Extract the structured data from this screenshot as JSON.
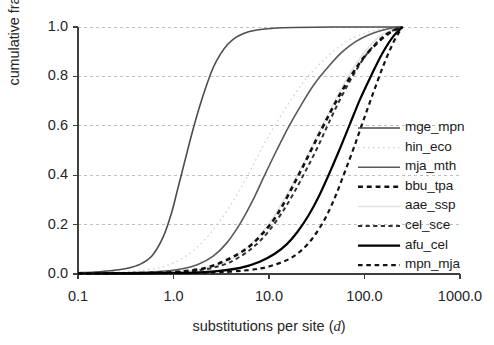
{
  "chart_data": {
    "type": "line",
    "title": "",
    "xlabel": "substitutions per site (d)",
    "xlabel_plain": "substitutions per site",
    "xlabel_italic_symbol": "d",
    "ylabel": "cumulative fraction",
    "xscale": "log",
    "yscale": "linear",
    "xlim": [
      0.1,
      1000.0
    ],
    "ylim": [
      0.0,
      1.0
    ],
    "xticks": [
      "0.1",
      "1.0",
      "10.0",
      "100.0",
      "1000.0"
    ],
    "xtick_values": [
      0.1,
      1.0,
      10.0,
      100.0,
      1000.0
    ],
    "yticks": [
      "0.0",
      "0.2",
      "0.4",
      "0.6",
      "0.8",
      "1.0"
    ],
    "ytick_values": [
      0.0,
      0.2,
      0.4,
      0.6,
      0.8,
      1.0
    ],
    "grid": "horizontal-dashed",
    "legend_position": "right-center",
    "series": [
      {
        "name": "mge_mpn",
        "color": "#4d4d4d",
        "style": "solid",
        "width": 1.6,
        "x": [
          0.1,
          0.15,
          0.22,
          0.32,
          0.45,
          0.6,
          0.78,
          0.95,
          1.1,
          1.3,
          1.55,
          1.85,
          2.2,
          2.6,
          3.1,
          3.7,
          4.5,
          5.5,
          7.0,
          9.0,
          12.0,
          18.0,
          30.0,
          60.0,
          120.0,
          250.0
        ],
        "y": [
          0.005,
          0.008,
          0.013,
          0.022,
          0.04,
          0.075,
          0.15,
          0.245,
          0.34,
          0.45,
          0.565,
          0.67,
          0.76,
          0.835,
          0.89,
          0.93,
          0.958,
          0.975,
          0.986,
          0.992,
          0.996,
          0.998,
          0.999,
          1.0,
          1.0,
          1.0
        ]
      },
      {
        "name": "hin_eco",
        "color": "#d2d2d2",
        "style": "dotted",
        "width": 1.3,
        "x": [
          0.1,
          0.2,
          0.4,
          0.7,
          1.0,
          1.5,
          2.2,
          3.2,
          4.6,
          6.5,
          9.0,
          13.0,
          18.0,
          25.0,
          36.0,
          50.0,
          70.0,
          100.0,
          140.0,
          200.0,
          250.0
        ],
        "y": [
          0.003,
          0.006,
          0.012,
          0.025,
          0.045,
          0.085,
          0.145,
          0.225,
          0.32,
          0.425,
          0.53,
          0.635,
          0.72,
          0.795,
          0.86,
          0.91,
          0.948,
          0.974,
          0.99,
          0.998,
          1.0
        ]
      },
      {
        "name": "mja_mth",
        "color": "#595959",
        "style": "solid",
        "width": 1.6,
        "x": [
          0.1,
          0.3,
          0.7,
          1.2,
          1.8,
          2.6,
          3.6,
          5.0,
          6.8,
          9.0,
          12.0,
          16.0,
          22.0,
          30.0,
          42.0,
          58.0,
          80.0,
          110.0,
          150.0,
          200.0,
          250.0
        ],
        "y": [
          0.003,
          0.005,
          0.01,
          0.02,
          0.038,
          0.072,
          0.125,
          0.205,
          0.3,
          0.4,
          0.5,
          0.595,
          0.688,
          0.77,
          0.84,
          0.898,
          0.94,
          0.968,
          0.986,
          0.997,
          1.0
        ]
      },
      {
        "name": "bbu_tpa",
        "color": "#111111",
        "style": "dashed-bold",
        "width": 2.6,
        "x": [
          0.1,
          0.5,
          1.2,
          2.2,
          3.4,
          4.8,
          6.4,
          8.4,
          11.0,
          14.0,
          18.0,
          23.0,
          30.0,
          40.0,
          55.0,
          75.0,
          100.0,
          140.0,
          190.0,
          250.0
        ],
        "y": [
          0.002,
          0.004,
          0.01,
          0.025,
          0.052,
          0.082,
          0.115,
          0.16,
          0.215,
          0.28,
          0.36,
          0.44,
          0.53,
          0.625,
          0.725,
          0.812,
          0.88,
          0.94,
          0.98,
          1.0
        ]
      },
      {
        "name": "aae_ssp",
        "color": "#e2e2e2",
        "style": "solid",
        "width": 1.5,
        "x": [
          0.1,
          0.6,
          1.5,
          3.0,
          5.0,
          7.5,
          10.5,
          14.0,
          19.0,
          25.0,
          33.0,
          44.0,
          58.0,
          78.0,
          105.0,
          140.0,
          190.0,
          250.0
        ],
        "y": [
          0.002,
          0.005,
          0.014,
          0.04,
          0.085,
          0.145,
          0.215,
          0.295,
          0.385,
          0.475,
          0.57,
          0.665,
          0.755,
          0.84,
          0.908,
          0.958,
          0.988,
          1.0
        ]
      },
      {
        "name": "cel_sce",
        "color": "#333333",
        "style": "dashed",
        "width": 2.0,
        "x": [
          0.1,
          0.6,
          1.6,
          3.2,
          5.2,
          7.4,
          10.0,
          13.5,
          18.0,
          24.0,
          32.0,
          42.0,
          56.0,
          75.0,
          100.0,
          135.0,
          180.0,
          250.0
        ],
        "y": [
          0.002,
          0.004,
          0.012,
          0.035,
          0.075,
          0.12,
          0.175,
          0.245,
          0.325,
          0.415,
          0.51,
          0.61,
          0.71,
          0.8,
          0.878,
          0.938,
          0.978,
          1.0
        ]
      },
      {
        "name": "afu_cel",
        "color": "#000000",
        "style": "solid",
        "width": 2.2,
        "x": [
          0.1,
          1.0,
          2.5,
          5.0,
          8.0,
          11.5,
          15.5,
          20.0,
          26.0,
          33.0,
          42.0,
          54.0,
          70.0,
          90.0,
          118.0,
          152.0,
          200.0,
          250.0
        ],
        "y": [
          0.002,
          0.004,
          0.01,
          0.025,
          0.05,
          0.082,
          0.122,
          0.172,
          0.238,
          0.312,
          0.4,
          0.498,
          0.605,
          0.708,
          0.805,
          0.89,
          0.962,
          1.0
        ]
      },
      {
        "name": "mpn_mja",
        "color": "#141414",
        "style": "dashed",
        "width": 2.2,
        "x": [
          0.1,
          1.5,
          4.0,
          8.0,
          12.0,
          16.5,
          21.0,
          26.0,
          32.0,
          40.0,
          50.0,
          62.0,
          78.0,
          98.0,
          124.0,
          158.0,
          205.0,
          250.0
        ],
        "y": [
          0.002,
          0.004,
          0.01,
          0.022,
          0.04,
          0.062,
          0.09,
          0.125,
          0.172,
          0.235,
          0.318,
          0.412,
          0.515,
          0.625,
          0.735,
          0.845,
          0.945,
          1.0
        ]
      }
    ]
  },
  "legend": {
    "entries": [
      {
        "label": "mge_mpn"
      },
      {
        "label": "hin_eco"
      },
      {
        "label": "mja_mth"
      },
      {
        "label": "bbu_tpa"
      },
      {
        "label": "aae_ssp"
      },
      {
        "label": "cel_sce"
      },
      {
        "label": "afu_cel"
      },
      {
        "label": "mpn_mja"
      }
    ]
  },
  "axes": {
    "y_title": "cumulative fraction",
    "x_title_prefix": "substitutions per site (",
    "x_title_symbol": "d",
    "x_title_suffix": ")"
  },
  "style": {
    "background": "#ffffff",
    "grid_color": "#bfbfbf",
    "axis_color": "#404040",
    "text_color": "#262626"
  }
}
